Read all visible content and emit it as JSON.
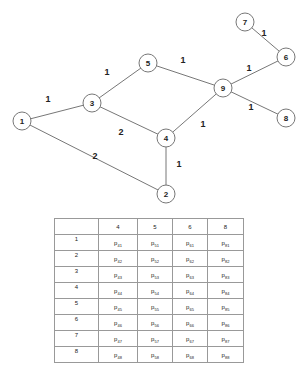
{
  "graph": {
    "nodes": [
      {
        "id": "1",
        "label": "1",
        "x": 22,
        "y": 121
      },
      {
        "id": "2",
        "label": "2",
        "x": 166,
        "y": 194
      },
      {
        "id": "3",
        "label": "3",
        "x": 92,
        "y": 103
      },
      {
        "id": "4",
        "label": "4",
        "x": 166,
        "y": 138
      },
      {
        "id": "5",
        "label": "5",
        "x": 148,
        "y": 63
      },
      {
        "id": "6",
        "label": "6",
        "x": 286,
        "y": 57
      },
      {
        "id": "7",
        "label": "7",
        "x": 245,
        "y": 22
      },
      {
        "id": "8",
        "label": "8",
        "x": 286,
        "y": 118
      },
      {
        "id": "9",
        "label": "9",
        "x": 223,
        "y": 88
      }
    ],
    "edges": [
      {
        "from": "1",
        "to": "3",
        "weight": "1",
        "lx": 48,
        "ly": 99
      },
      {
        "from": "1",
        "to": "2",
        "weight": "2",
        "lx": 95,
        "ly": 156
      },
      {
        "from": "3",
        "to": "5",
        "weight": "1",
        "lx": 107,
        "ly": 72
      },
      {
        "from": "3",
        "to": "4",
        "weight": "2",
        "lx": 121,
        "ly": 132
      },
      {
        "from": "5",
        "to": "9",
        "weight": "1",
        "lx": 183,
        "ly": 60
      },
      {
        "from": "4",
        "to": "9",
        "weight": "1",
        "lx": 203,
        "ly": 124
      },
      {
        "from": "4",
        "to": "2",
        "weight": "1",
        "lx": 179,
        "ly": 164
      },
      {
        "from": "9",
        "to": "6",
        "weight": "1",
        "lx": 249,
        "ly": 68
      },
      {
        "from": "9",
        "to": "8",
        "weight": "1",
        "lx": 251,
        "ly": 107
      },
      {
        "from": "7",
        "to": "6",
        "weight": "1",
        "lx": 264,
        "ly": 33
      }
    ],
    "node_radius": 9
  },
  "table": {
    "headers": [
      "",
      "4",
      "5",
      "6",
      "8"
    ],
    "rows": [
      {
        "label": "1",
        "cells": [
          [
            "p",
            "41"
          ],
          [
            "p",
            "51"
          ],
          [
            "p",
            "61"
          ],
          [
            "p",
            "81"
          ]
        ]
      },
      {
        "label": "2",
        "cells": [
          [
            "p",
            "42"
          ],
          [
            "p",
            "52"
          ],
          [
            "p",
            "62"
          ],
          [
            "p",
            "82"
          ]
        ]
      },
      {
        "label": "3",
        "cells": [
          [
            "p",
            "43"
          ],
          [
            "p",
            "53"
          ],
          [
            "p",
            "63"
          ],
          [
            "p",
            "83"
          ]
        ]
      },
      {
        "label": "4",
        "cells": [
          [
            "p",
            "44"
          ],
          [
            "p",
            "54"
          ],
          [
            "p",
            "64"
          ],
          [
            "p",
            "84"
          ]
        ]
      },
      {
        "label": "5",
        "cells": [
          [
            "p",
            "45"
          ],
          [
            "p",
            "55"
          ],
          [
            "p",
            "65"
          ],
          [
            "p",
            "85"
          ]
        ]
      },
      {
        "label": "6",
        "cells": [
          [
            "p",
            "46"
          ],
          [
            "p",
            "56"
          ],
          [
            "p",
            "66"
          ],
          [
            "p",
            "86"
          ]
        ]
      },
      {
        "label": "7",
        "cells": [
          [
            "p",
            "47"
          ],
          [
            "p",
            "57"
          ],
          [
            "p",
            "67"
          ],
          [
            "p",
            "87"
          ]
        ]
      },
      {
        "label": "8",
        "cells": [
          [
            "p",
            "48"
          ],
          [
            "p",
            "58"
          ],
          [
            "p",
            "68"
          ],
          [
            "p",
            "88"
          ]
        ]
      }
    ]
  }
}
